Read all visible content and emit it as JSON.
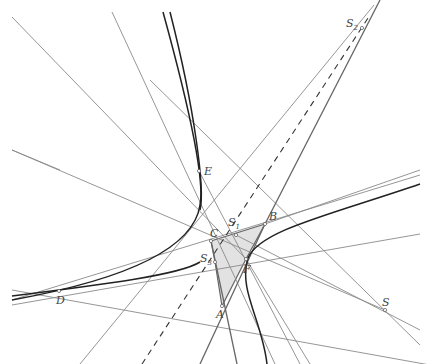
{
  "diagram": {
    "colors": {
      "background": "#ffffff",
      "triangle_fill": "#e2e2e2",
      "line": "#8a8a8a",
      "curve": "#222222"
    },
    "points": [
      {
        "id": "S2",
        "label": "S",
        "sub": "2",
        "x": 362,
        "y": 28,
        "lx": 346,
        "ly": 27
      },
      {
        "id": "E",
        "label": "E",
        "sub": "",
        "x": 199,
        "y": 171,
        "lx": 204,
        "ly": 175
      },
      {
        "id": "S1",
        "label": "S",
        "sub": "1",
        "x": 236,
        "y": 235,
        "lx": 228,
        "ly": 224
      },
      {
        "id": "B",
        "label": "B",
        "sub": "",
        "x": 265,
        "y": 224,
        "lx": 270,
        "ly": 219
      },
      {
        "id": "C",
        "label": "C",
        "sub": "",
        "x": 211,
        "y": 241,
        "lx": 211,
        "ly": 237
      },
      {
        "id": "S3",
        "label": "S",
        "sub": "3",
        "x": 215,
        "y": 262,
        "lx": 200,
        "ly": 262
      },
      {
        "id": "F",
        "label": "F",
        "sub": "",
        "x": 246,
        "y": 259,
        "lx": 244,
        "ly": 275
      },
      {
        "id": "D",
        "label": "D",
        "sub": "",
        "x": 59,
        "y": 291,
        "lx": 57,
        "ly": 304
      },
      {
        "id": "A",
        "label": "A",
        "sub": "",
        "x": 222,
        "y": 306,
        "lx": 216,
        "ly": 316
      },
      {
        "id": "S",
        "label": "S",
        "sub": "",
        "x": 385,
        "y": 310,
        "lx": 383,
        "ly": 305
      }
    ]
  }
}
